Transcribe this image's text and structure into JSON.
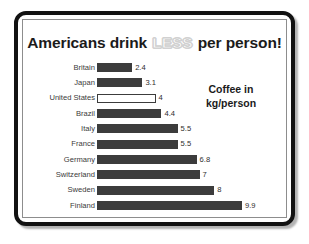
{
  "figure": {
    "title_prefix": "Americans drink",
    "title_emphasis": "LESS",
    "title_suffix": "per person!",
    "legend_line1": "Coffee in",
    "legend_line2": "kg/person",
    "bar_color": "#3c3c3c",
    "highlight_bar_color": "#ffffff",
    "frame_color": "#121212",
    "title_color": "#1b1b1b",
    "emphasis_outline_color": "#cfcfcf"
  },
  "chart_data": {
    "type": "bar",
    "orientation": "horizontal",
    "title": "Americans drink LESS per person!",
    "xlabel": "Coffee in kg/person",
    "ylabel": "",
    "xlim": [
      0,
      9.9
    ],
    "grid": false,
    "legend": "Coffee in kg/person",
    "legend_position": "right",
    "value_labels": true,
    "sorted": "ascending",
    "highlight_category": "United States",
    "categories": [
      "Britain",
      "Japan",
      "United States",
      "Brazil",
      "Italy",
      "France",
      "Germany",
      "Switzerland",
      "Sweden",
      "Finland"
    ],
    "values": [
      2.4,
      3.1,
      4,
      4.4,
      5.5,
      5.5,
      6.8,
      7,
      8,
      9.9
    ],
    "value_label_text": [
      "2.4",
      "3.1",
      "4",
      "4.4",
      "5.5",
      "5.5",
      "6.8",
      "7",
      "8",
      "9.9"
    ],
    "bars": [
      {
        "label": "Britain",
        "value": 2.4,
        "text": "2.4",
        "style": "filled"
      },
      {
        "label": "Japan",
        "value": 3.1,
        "text": "3.1",
        "style": "filled"
      },
      {
        "label": "United States",
        "value": 4,
        "text": "4",
        "style": "hollow"
      },
      {
        "label": "Brazil",
        "value": 4.4,
        "text": "4.4",
        "style": "filled"
      },
      {
        "label": "Italy",
        "value": 5.5,
        "text": "5.5",
        "style": "filled"
      },
      {
        "label": "France",
        "value": 5.5,
        "text": "5.5",
        "style": "filled"
      },
      {
        "label": "Germany",
        "value": 6.8,
        "text": "6.8",
        "style": "filled"
      },
      {
        "label": "Switzerland",
        "value": 7,
        "text": "7",
        "style": "filled"
      },
      {
        "label": "Sweden",
        "value": 8,
        "text": "8",
        "style": "filled"
      },
      {
        "label": "Finland",
        "value": 9.9,
        "text": "9.9",
        "style": "filled"
      }
    ]
  }
}
